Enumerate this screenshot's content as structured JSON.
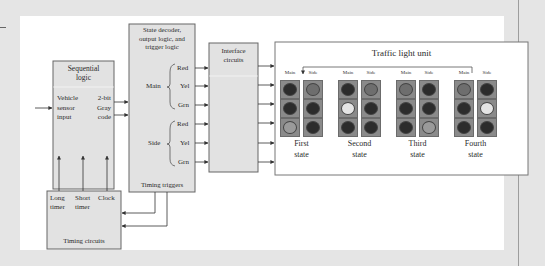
{
  "diagram": {
    "sequential_logic": {
      "title_line1": "Sequential",
      "title_line2": "logic",
      "input_line1": "Vehicle",
      "input_line2": "sensor",
      "input_line3": "input",
      "output_line1": "2-bit",
      "output_line2": "Gray",
      "output_line3": "code"
    },
    "state_decoder": {
      "title_line1": "State decoder,",
      "title_line2": "output logic, and",
      "title_line3": "trigger logic",
      "main_label": "Main",
      "side_label": "Side",
      "main_outputs": [
        "Red",
        "Yel",
        "Grn"
      ],
      "side_outputs": [
        "Red",
        "Yel",
        "Grn"
      ],
      "footer": "Timing triggers"
    },
    "interface": {
      "title_line1": "Interface",
      "title_line2": "circuits"
    },
    "timing_circuits": {
      "col1_line1": "Long",
      "col1_line2": "timer",
      "col2_line1": "Short",
      "col2_line2": "timer",
      "col3_line1": "Clock",
      "footer": "Timing circuits"
    },
    "traffic_unit": {
      "title": "Traffic light unit",
      "colors": {
        "frame": "#6b6b6b",
        "off": "#2c2c2c",
        "red_on": "#6e6e6e",
        "yellow_on": "#e4e4e4",
        "green_on": "#9a9a9a",
        "cell_bg": "#8a8a8a"
      },
      "states": [
        {
          "label_line1": "First",
          "label_line2": "state",
          "main_label": "Main",
          "side_label": "Side",
          "main": [
            "off",
            "off",
            "green_on"
          ],
          "side": [
            "red_on",
            "off",
            "off"
          ]
        },
        {
          "label_line1": "Second",
          "label_line2": "state",
          "main_label": "Main",
          "side_label": "Side",
          "main": [
            "off",
            "yellow_on",
            "off"
          ],
          "side": [
            "red_on",
            "off",
            "off"
          ]
        },
        {
          "label_line1": "Third",
          "label_line2": "state",
          "main_label": "Main",
          "side_label": "Side",
          "main": [
            "red_on",
            "off",
            "off"
          ],
          "side": [
            "off",
            "off",
            "green_on"
          ]
        },
        {
          "label_line1": "Fourth",
          "label_line2": "state",
          "main_label": "Main",
          "side_label": "Side",
          "main": [
            "red_on",
            "off",
            "off"
          ],
          "side": [
            "off",
            "yellow_on",
            "off"
          ]
        }
      ]
    }
  }
}
